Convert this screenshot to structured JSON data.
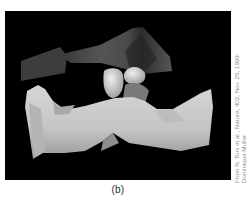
{
  "figure": {
    "panel_label": "(b)",
    "colors": {
      "background": "#000000",
      "upper_structure": "#4a4a4a",
      "lower_structure": "#c8c8c8",
      "caption_text": "#2a2a2a",
      "credit_text": "#8f8f8f"
    }
  },
  "credit": {
    "line1": "From N. Toni et al., Nature, 402, Nov. 25, 1999.",
    "line2": "Dominique Muller"
  }
}
